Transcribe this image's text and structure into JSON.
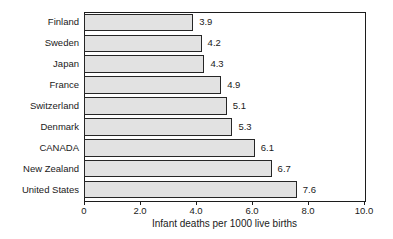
{
  "chart_data": {
    "type": "bar",
    "orientation": "horizontal",
    "title": "",
    "xlabel": "Infant deaths per 1000 live births",
    "ylabel": "",
    "categories": [
      "Finland",
      "Sweden",
      "Japan",
      "France",
      "Switzerland",
      "Denmark",
      "CANADA",
      "New Zealand",
      "United States"
    ],
    "values": [
      3.9,
      4.2,
      4.3,
      4.9,
      5.1,
      5.3,
      6.1,
      6.7,
      7.6
    ],
    "value_labels": [
      "3.9",
      "4.2",
      "4.3",
      "4.9",
      "5.1",
      "5.3",
      "6.1",
      "6.7",
      "7.6"
    ],
    "xlim": [
      0,
      10
    ],
    "xticks": [
      0,
      2,
      4,
      6,
      8,
      10
    ],
    "xtick_labels": [
      "0",
      "2.0",
      "4.0",
      "6.0",
      "8.0",
      "10.0"
    ],
    "grid": false,
    "legend": null,
    "bar_fill_color": "#e2e2e2",
    "bar_border_color": "#262626",
    "axis_color": "#1c1c1c",
    "background_color": "#ffffff"
  }
}
